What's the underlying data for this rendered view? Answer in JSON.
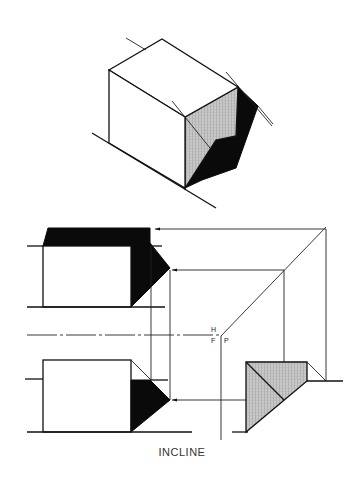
{
  "figure": {
    "caption": "INCLINE",
    "plane_labels": {
      "horizontal": "H",
      "frontal": "F",
      "profile": "P"
    },
    "views": [
      "pictorial",
      "top-view",
      "front-view",
      "side-view"
    ],
    "colors": {
      "line": "#111111",
      "shadow": "#0a0a0a",
      "shade": "#bdbdbd",
      "background": "#ffffff"
    }
  }
}
